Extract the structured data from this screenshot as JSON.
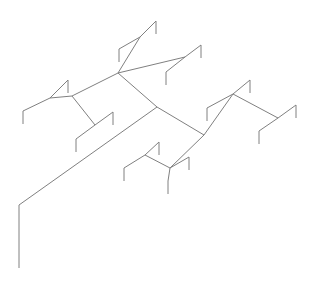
{
  "figure": {
    "type": "line-drawing",
    "width": 316,
    "height": 281,
    "background_color": "#ffffff",
    "stroke_color": "#808080",
    "stroke_width": 1
  },
  "geometry": {
    "root_stem": {
      "name": "root-stem",
      "points": "19,268 19,205"
    },
    "trunk": {
      "name": "main-trunk",
      "points": "19,205 157,107"
    },
    "edges": [
      {
        "name": "trunk-to-upper-fork",
        "points": "157,107 118,73"
      },
      {
        "name": "upper-fork-to-top-node",
        "points": "118,73 140,37"
      },
      {
        "name": "top-node-to-leaf-a-arm",
        "points": "140,37 156,21"
      },
      {
        "name": "leaf-a-tick",
        "points": "156,21 156,34"
      },
      {
        "name": "top-node-to-leaf-b-arm",
        "points": "140,37 119,49"
      },
      {
        "name": "leaf-b-tick",
        "points": "119,49 119,62"
      },
      {
        "name": "upper-fork-to-right-node",
        "points": "118,73 185,57"
      },
      {
        "name": "right-node-to-leaf-c-arm",
        "points": "185,57 201,45"
      },
      {
        "name": "leaf-c-tick",
        "points": "201,45 201,58"
      },
      {
        "name": "right-node-to-leaf-d-arm",
        "points": "185,57 166,72"
      },
      {
        "name": "leaf-d-tick",
        "points": "166,72 166,85"
      },
      {
        "name": "upper-fork-to-left-node",
        "points": "118,73 72,96"
      },
      {
        "name": "left-node-to-sub-node",
        "points": "72,96 50,98"
      },
      {
        "name": "sub-node-to-leaf-e-arm",
        "points": "50,98 68,80"
      },
      {
        "name": "leaf-e-tick",
        "points": "68,80 68,93"
      },
      {
        "name": "sub-node-to-leaf-f-arm",
        "points": "50,98 23,111"
      },
      {
        "name": "leaf-f-tick",
        "points": "23,111 23,124"
      },
      {
        "name": "left-node-to-lower-node",
        "points": "72,96 95,125"
      },
      {
        "name": "lower-node-to-leaf-g-arm",
        "points": "95,125 113,112"
      },
      {
        "name": "leaf-g-tick",
        "points": "113,112 113,125"
      },
      {
        "name": "lower-node-to-leaf-h-arm",
        "points": "95,125 76,139"
      },
      {
        "name": "leaf-h-tick",
        "points": "76,139 76,152"
      },
      {
        "name": "trunk-to-lower-fork",
        "points": "157,107 204,135"
      },
      {
        "name": "lower-fork-to-right-cluster",
        "points": "204,135 233,94"
      },
      {
        "name": "right-cluster-to-leaf-i-arm",
        "points": "233,94 250,80"
      },
      {
        "name": "leaf-i-tick",
        "points": "250,80 250,93"
      },
      {
        "name": "right-cluster-to-leaf-j-arm",
        "points": "233,94 207,108"
      },
      {
        "name": "leaf-j-tick",
        "points": "207,108 207,121"
      },
      {
        "name": "right-cluster-to-outer-node",
        "points": "233,94 278,118"
      },
      {
        "name": "outer-node-to-leaf-k-arm",
        "points": "278,118 296,105"
      },
      {
        "name": "leaf-k-tick",
        "points": "296,105 296,118"
      },
      {
        "name": "outer-node-to-leaf-l-arm",
        "points": "278,118 259,131"
      },
      {
        "name": "leaf-l-tick",
        "points": "259,131 259,144"
      },
      {
        "name": "lower-fork-to-mid-node",
        "points": "204,135 170,168"
      },
      {
        "name": "mid-node-to-upper-sub",
        "points": "170,168 145,155"
      },
      {
        "name": "upper-sub-to-leaf-m-arm",
        "points": "145,155 159,142"
      },
      {
        "name": "leaf-m-tick",
        "points": "159,142 159,155"
      },
      {
        "name": "upper-sub-to-leaf-n-arm",
        "points": "145,155 124,168"
      },
      {
        "name": "leaf-n-tick",
        "points": "124,168 124,181"
      },
      {
        "name": "mid-node-to-leaf-o-arm",
        "points": "170,168 189,157"
      },
      {
        "name": "leaf-o-tick",
        "points": "189,157 189,170"
      },
      {
        "name": "mid-node-to-leaf-p-arm",
        "points": "170,168 168,181"
      },
      {
        "name": "leaf-p-tick",
        "points": "168,181 168,194"
      }
    ]
  }
}
